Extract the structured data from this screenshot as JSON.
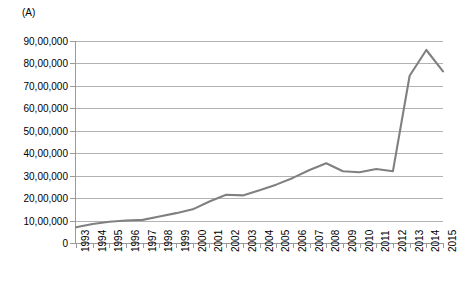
{
  "panel": {
    "label": "(A)"
  },
  "chart_data": {
    "type": "line",
    "title": "",
    "subtitle": "",
    "xlabel": "",
    "ylabel": "",
    "grid": true,
    "legend": false,
    "legend_position": "none",
    "line_color": "#808080",
    "grid_color": "#b3b3b3",
    "axis_color": "#9a9a9a",
    "ylim": [
      0,
      9000000
    ],
    "ytick_labels": [
      "90,00,000",
      "80,00,000",
      "70,00,000",
      "60,00,000",
      "50,00,000",
      "40,00,000",
      "30,00,000",
      "20,00,000",
      "10,00,000",
      "0"
    ],
    "ytick_values": [
      9000000,
      8000000,
      7000000,
      6000000,
      5000000,
      4000000,
      3000000,
      2000000,
      1000000,
      0
    ],
    "categories": [
      "1993",
      "1994",
      "1995",
      "1996",
      "1997",
      "1998",
      "1999",
      "2000",
      "2001",
      "2002",
      "2003",
      "2004",
      "2005",
      "2006",
      "2007",
      "2008",
      "2009",
      "2010",
      "2011",
      "2012",
      "2013",
      "2014",
      "2015"
    ],
    "values": [
      700000,
      850000,
      950000,
      1000000,
      1030000,
      1180000,
      1330000,
      1500000,
      1850000,
      2150000,
      2120000,
      2350000,
      2600000,
      2900000,
      3250000,
      3550000,
      3200000,
      3150000,
      3300000,
      3200000,
      7450000,
      8600000,
      7650000
    ]
  }
}
